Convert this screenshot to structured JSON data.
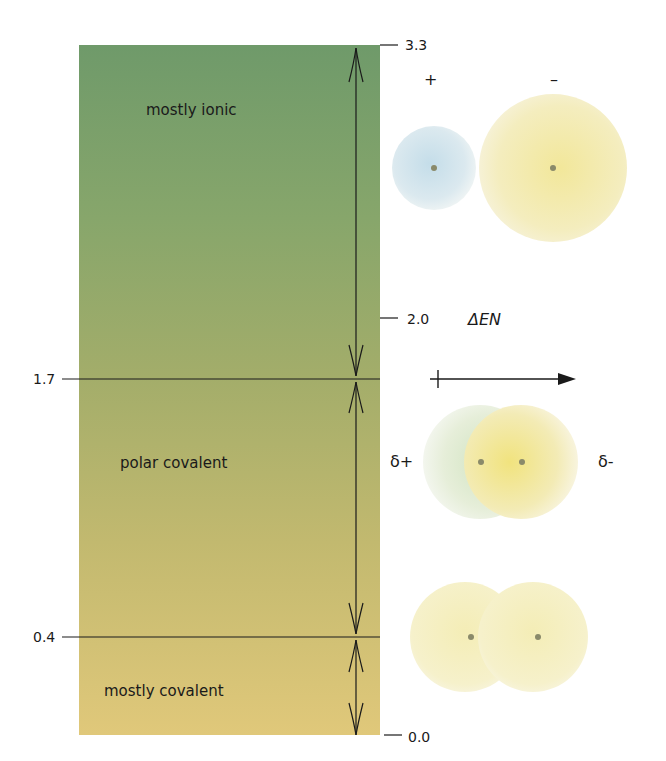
{
  "regions": [
    {
      "label": "mostly ionic",
      "range": [
        2.0,
        3.3
      ]
    },
    {
      "label": "polar covalent",
      "range": [
        0.4,
        1.7
      ]
    },
    {
      "label": "mostly covalent",
      "range": [
        0.0,
        0.4
      ]
    }
  ],
  "scale": {
    "ticks_right": [
      "3.3",
      "2.0",
      "0.0"
    ],
    "ticks_left": [
      "1.7",
      "0.4"
    ]
  },
  "axis": {
    "label": "ΔEN",
    "direction_icon": "right-arrow-icon"
  },
  "ionic_pair": {
    "cation_sign": "+",
    "anion_sign": "–"
  },
  "polar_pair": {
    "left_charge": "δ+",
    "right_charge": "δ-"
  },
  "colors": {
    "top": "#6f9a6a",
    "middle": "#a3ad6a",
    "bottom": "#e0c87a",
    "cation": "#cfe3ec",
    "anion": "#f3ecb0",
    "nucleus": "#8a8a6a"
  }
}
